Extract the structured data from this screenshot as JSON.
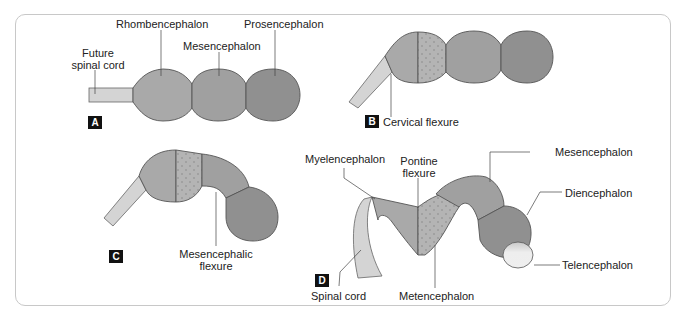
{
  "figure": {
    "panels": [
      {
        "id": "A",
        "labels": {
          "future_spinal_cord": "Future\nspinal cord",
          "rhombencephalon": "Rhombencephalon",
          "mesencephalon": "Mesencephalon",
          "prosencephalon": "Prosencephalon"
        }
      },
      {
        "id": "B",
        "labels": {
          "cervical_flexure": "Cervical flexure"
        }
      },
      {
        "id": "C",
        "labels": {
          "mesencephalic_flexure": "Mesencephalic\nflexure"
        }
      },
      {
        "id": "D",
        "labels": {
          "myelencephalon": "Myelencephalon",
          "pontine_flexure": "Pontine\nflexure",
          "mesencephalon": "Mesencephalon",
          "diencephalon": "Diencephalon",
          "telencephalon": "Telencephalon",
          "spinal_cord": "Spinal cord",
          "metencephalon": "Metencephalon"
        }
      }
    ],
    "colors": {
      "spinal_cord": "#d4d4d4",
      "rhombencephalon": "#a9a9a9",
      "mesencephalon": "#a0a0a0",
      "prosencephalon": "#909090",
      "metencephalon_dotted": "#b4b4b4",
      "telencephalon": "#ececec",
      "outline": "#555555",
      "border": "#c8c8c8"
    }
  }
}
